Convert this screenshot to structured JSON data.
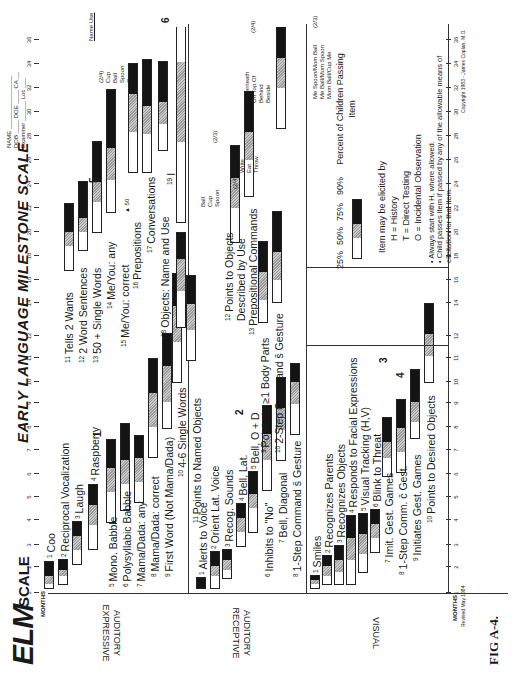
{
  "header": {
    "logo": "ELM",
    "logo_suffix": "SCALE",
    "title": "EARLY LANGUAGE MILESTONE SCALE",
    "form_fields": [
      "NAME",
      "DOB",
      "DOE",
      "Examiner",
      "Loc",
      "CA"
    ]
  },
  "axis": {
    "label": "MONTHS",
    "revised": "Revised May 1984",
    "ticks": [
      "1",
      "2",
      "3",
      "4",
      "5",
      "6",
      "7",
      "8",
      "9",
      "10",
      "11",
      "12",
      "14",
      "16",
      "18",
      "20",
      "22",
      "24",
      "26",
      "28",
      "30",
      "32",
      "34",
      "36"
    ],
    "copyright": "Copyright 1983 - James Coplan, M.D."
  },
  "sections": {
    "expressive": "AUDITORY EXPRESSIVE",
    "receptive": "AUDITORY RECEPTIVE",
    "visual": "VISUAL"
  },
  "expressive_items": [
    {
      "n": "1",
      "label": "Coo"
    },
    {
      "n": "2",
      "label": "Reciprocal Vocalization"
    },
    {
      "n": "3",
      "label": "Laugh"
    },
    {
      "n": "4",
      "label": "Raspberry"
    },
    {
      "n": "5",
      "label": "Mono. Babble"
    },
    {
      "n": "6",
      "label": "Polysyllabic Babble"
    },
    {
      "n": "7",
      "label": "Mama/Dada: any"
    },
    {
      "n": "8",
      "label": "Mama/Dada: correct"
    },
    {
      "n": "9",
      "label": "First Word (Not Mama/Dada)"
    },
    {
      "n": "10",
      "label": "4-6 Single Words"
    },
    {
      "n": "11",
      "label": "Tells 2 Wants"
    },
    {
      "n": "12",
      "label": "2 Word Sentences"
    },
    {
      "n": "13",
      "label": "50 + Single Words"
    },
    {
      "n": "14",
      "label": "Me/You: any"
    },
    {
      "n": "15",
      "label": "Me/You: correct"
    },
    {
      "n": "16",
      "label": "Prepositions"
    },
    {
      "n": "17",
      "label": "Conversations"
    },
    {
      "n": "18",
      "label": "Objects: Name and Use"
    },
    {
      "n": "19",
      "label": "I"
    }
  ],
  "receptive_items": [
    {
      "n": "1",
      "label": "Alerts to Voice"
    },
    {
      "n": "2",
      "label": "Orient Lat. Voice"
    },
    {
      "n": "3",
      "label": "Recog. Sounds"
    },
    {
      "n": "4",
      "label": "Bell, Lat."
    },
    {
      "n": "5",
      "label": "Bell, O + D"
    },
    {
      "n": "6",
      "label": "Inhibits to \"No\""
    },
    {
      "n": "7",
      "label": "Bell, Diagonal"
    },
    {
      "n": "8",
      "label": "1-Step Command s̄ Gesture"
    },
    {
      "n": "9",
      "label": "Points to ≥1 Body Parts"
    },
    {
      "n": "10",
      "label": "2-Step Command s̄ Gesture"
    },
    {
      "n": "11",
      "label": "Points to Named Objects"
    },
    {
      "n": "12",
      "label": "Points to Objects Described by Use"
    },
    {
      "n": "13",
      "label": "Prepositional Commands"
    }
  ],
  "visual_items": [
    {
      "n": "1",
      "label": "Smiles"
    },
    {
      "n": "2",
      "label": "Recognizes Parents"
    },
    {
      "n": "3",
      "label": "Recognizes Objects"
    },
    {
      "n": "4",
      "label": "Responds to Facial Expressions"
    },
    {
      "n": "5",
      "label": "Visual Tracking (H,V)"
    },
    {
      "n": "6",
      "label": "Blink to Threat"
    },
    {
      "n": "7",
      "label": "Imit. Gest. Games"
    },
    {
      "n": "8",
      "label": "1-Step Comm. c̄ Gest."
    },
    {
      "n": "9",
      "label": "Initiates Gest. Games"
    },
    {
      "n": "10",
      "label": "Points to Desired Objects"
    }
  ],
  "checklists": {
    "name_use": {
      "header": "Name Use",
      "score": "(2/4)",
      "items": [
        "Cup",
        "Ball",
        "Spoon",
        "Crayon"
      ]
    },
    "ball_cup_spoon": {
      "score": "(2/3)",
      "items": [
        "Ball",
        "Cup",
        "Spoon"
      ]
    },
    "use": {
      "score": "(2/4)",
      "items": [
        "Drink",
        "Write",
        "Eat",
        "Throw"
      ]
    },
    "prepositions": {
      "score": "(2/4)",
      "items": [
        "Underneath",
        "On Top Of",
        "Behind",
        "Beside"
      ]
    },
    "two_step": {
      "score": "(2/3)",
      "items": [
        "Me Spoon/Mom Ball",
        "Me Ball/Mom Spoon",
        "Mom Ball/Cup Me"
      ]
    }
  },
  "annotations": {
    "a1": "1",
    "a2": "2",
    "a3": "3",
    "a4": "4",
    "a5": "5",
    "a6": "6",
    "marker50": "50"
  },
  "legend": {
    "percentiles": [
      "25%",
      "50%",
      "75%",
      "90%"
    ],
    "percent_label": "Percent of Children Passing Item",
    "elicited_by": "Item may be elicited by",
    "codes": [
      "H = History",
      "T = Direct Testing",
      "O = Incidental Observation"
    ],
    "notes": [
      "Always start with H, where allowed.",
      "Child passes item if passed by any of the allowable means of elicitation for that item."
    ]
  },
  "figure_caption": "FIG A-4."
}
